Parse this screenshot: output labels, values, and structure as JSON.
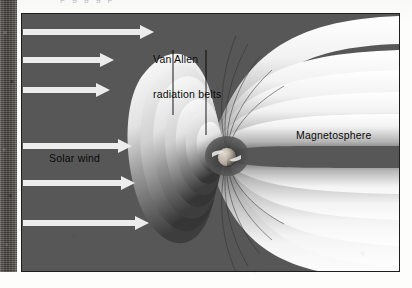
{
  "page": {
    "cut_off_text_fragment": "p    g                 g    g  p"
  },
  "figure": {
    "name": "earth-magnetosphere-diagram",
    "background_color": "#575757",
    "border_color": "#1e1e1e",
    "labels": {
      "van_allen_line1": "Van Allen",
      "van_allen_line2": "radiation belts",
      "solar_wind": "Solar wind",
      "magnetosphere": "Magnetosphere"
    },
    "elements": {
      "earth_name": "earth-sphere",
      "solar_wind_arrows_count": 6,
      "leader_lines_count": 2
    }
  }
}
